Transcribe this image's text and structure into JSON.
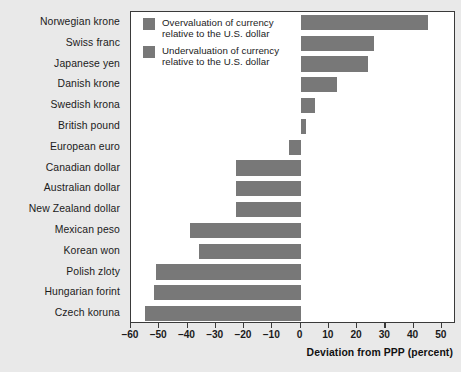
{
  "chart_data": {
    "type": "bar",
    "orientation": "horizontal",
    "title": "",
    "subtitle": "",
    "xlabel": "Deviation from PPP (percent)",
    "ylabel": "",
    "xlim": [
      -60,
      55
    ],
    "xticks": [
      -60,
      -50,
      -40,
      -30,
      -20,
      -10,
      0,
      10,
      20,
      30,
      40,
      50
    ],
    "xticklabels": [
      "–60",
      "–50",
      "–40",
      "–30",
      "–20",
      "–10",
      "0",
      "10",
      "20",
      "30",
      "40",
      "50"
    ],
    "grid": false,
    "legend_position": "inside-top-left",
    "categories": [
      "Norwegian krone",
      "Swiss franc",
      "Japanese yen",
      "Danish krone",
      "Swedish krona",
      "British pound",
      "European euro",
      "Canadian dollar",
      "Australian dollar",
      "New Zealand dollar",
      "Mexican peso",
      "Korean won",
      "Polish zloty",
      "Hungarian forint",
      "Czech koruna"
    ],
    "values": [
      45,
      26,
      24,
      13,
      5,
      2,
      -4,
      -23,
      -23,
      -23,
      -39,
      -36,
      -51,
      -52,
      -55
    ],
    "series": [
      {
        "name": "Deviation from PPP",
        "values": [
          45,
          26,
          24,
          13,
          5,
          2,
          -4,
          -23,
          -23,
          -23,
          -39,
          -36,
          -51,
          -52,
          -55
        ]
      }
    ],
    "bar_color": "#787878",
    "legend": [
      {
        "swatch_color": "#787878",
        "line1": "Overvaluation of currency",
        "line2": "relative to the U.S. dollar"
      },
      {
        "swatch_color": "#787878",
        "line1": "Undervaluation of currency",
        "line2": "relative to the U.S. dollar"
      }
    ]
  },
  "figure": {
    "background_color": "#e9e9e9",
    "plot_background_color": "#ffffff",
    "frame_color": "#3a3a3a"
  }
}
